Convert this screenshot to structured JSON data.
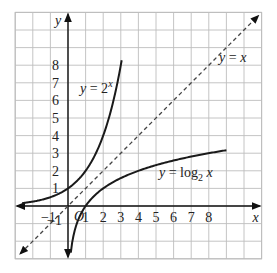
{
  "chart_data": {
    "type": "line",
    "title": "",
    "xlabel": "x",
    "ylabel": "y",
    "xlim": [
      -3,
      11
    ],
    "ylim": [
      -3,
      11
    ],
    "grid": true,
    "origin_label": "O",
    "x_ticks": [
      "-1",
      "1",
      "2",
      "3",
      "4",
      "5",
      "6",
      "7",
      "8"
    ],
    "x_tick_values": [
      -1,
      1,
      2,
      3,
      4,
      5,
      6,
      7,
      8
    ],
    "y_ticks": [
      "-1",
      "1",
      "2",
      "3",
      "4",
      "5",
      "6",
      "7",
      "8"
    ],
    "y_tick_values": [
      -1,
      1,
      2,
      3,
      4,
      5,
      6,
      7,
      8
    ],
    "series": [
      {
        "name": "y = 2^x",
        "label_text": "y = 2",
        "label_sup": "x",
        "style": "solid",
        "color": "#1a1a1a",
        "x_range": [
          -2.6,
          3.05
        ],
        "function": "exp2"
      },
      {
        "name": "y = x",
        "label_text": "y = x",
        "style": "dashed",
        "color": "#444444",
        "x_range": [
          -2.7,
          10.8
        ],
        "function": "identity"
      },
      {
        "name": "y = log2 x",
        "label_text": "y = log",
        "label_sub": "2",
        "label_tail": " x",
        "style": "solid",
        "color": "#1a1a1a",
        "x_range": [
          0.16,
          9.0
        ],
        "function": "log2"
      }
    ],
    "annotations": [
      "y = 2^x",
      "y = x",
      "y = log2 x"
    ]
  }
}
